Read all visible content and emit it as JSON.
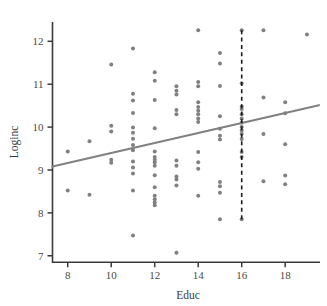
{
  "chart_data": {
    "type": "scatter",
    "title": "",
    "xlabel": "Educ",
    "ylabel": "Loginc",
    "xlim": [
      7.3,
      19.6
    ],
    "ylim": [
      6.85,
      12.45
    ],
    "xticks": [
      8,
      10,
      12,
      14,
      16,
      18
    ],
    "yticks": [
      7,
      8,
      9,
      10,
      11,
      12
    ],
    "xtick_labels": [
      "8",
      "10",
      "12",
      "14",
      "16",
      "18"
    ],
    "ytick_labels": [
      "7",
      "8",
      "9",
      "10",
      "11",
      "12"
    ],
    "grid": false,
    "legend": "none",
    "point_color": "#808080",
    "line_color": "#808080",
    "axis_color": "#3a3a3a",
    "marker_size": 2.0,
    "regression_line": {
      "name": "fitted regression line",
      "x": [
        7.3,
        19.55
      ],
      "y": [
        9.08,
        10.51
      ],
      "slope": 0.1167,
      "intercept": 8.228,
      "color": "#808080",
      "width": 2.2
    },
    "reference_line": {
      "name": "vertical dashed reference at Educ = 16",
      "orientation": "vertical",
      "x": 16,
      "y_from": 7.85,
      "y_to": 12.26,
      "style": "dashed",
      "color": "#1a1a1a",
      "width": 1.6
    },
    "points": [
      [
        8,
        9.43
      ],
      [
        8,
        8.52
      ],
      [
        9,
        9.67
      ],
      [
        9,
        8.42
      ],
      [
        10,
        11.46
      ],
      [
        10,
        10.03
      ],
      [
        10,
        9.9
      ],
      [
        10,
        9.24
      ],
      [
        10,
        9.17
      ],
      [
        11,
        11.83
      ],
      [
        11,
        10.78
      ],
      [
        11,
        10.62
      ],
      [
        11,
        10.33
      ],
      [
        11,
        9.99
      ],
      [
        11,
        9.87
      ],
      [
        11,
        9.73
      ],
      [
        11,
        9.58
      ],
      [
        11,
        9.46
      ],
      [
        11,
        9.2
      ],
      [
        11,
        9.06
      ],
      [
        11,
        8.92
      ],
      [
        11,
        8.52
      ],
      [
        11,
        7.47
      ],
      [
        12,
        11.28
      ],
      [
        12,
        11.08
      ],
      [
        12,
        10.63
      ],
      [
        12,
        9.97
      ],
      [
        12,
        9.43
      ],
      [
        12,
        9.3
      ],
      [
        12,
        9.24
      ],
      [
        12,
        9.18
      ],
      [
        12,
        9.1
      ],
      [
        12,
        8.88
      ],
      [
        12,
        8.6
      ],
      [
        12,
        8.4
      ],
      [
        12,
        8.32
      ],
      [
        12,
        8.24
      ],
      [
        12,
        8.18
      ],
      [
        13,
        10.95
      ],
      [
        13,
        10.85
      ],
      [
        13,
        10.76
      ],
      [
        13,
        10.4
      ],
      [
        13,
        10.3
      ],
      [
        13,
        9.22
      ],
      [
        13,
        9.1
      ],
      [
        13,
        8.85
      ],
      [
        13,
        8.78
      ],
      [
        13,
        8.64
      ],
      [
        13,
        7.07
      ],
      [
        14,
        12.26
      ],
      [
        14,
        11.05
      ],
      [
        14,
        10.95
      ],
      [
        14,
        10.58
      ],
      [
        14,
        10.47
      ],
      [
        14,
        10.38
      ],
      [
        14,
        10.3
      ],
      [
        14,
        10.2
      ],
      [
        14,
        10.12
      ],
      [
        14,
        9.42
      ],
      [
        14,
        9.18
      ],
      [
        14,
        9.03
      ],
      [
        14,
        8.4
      ],
      [
        15,
        11.73
      ],
      [
        15,
        11.48
      ],
      [
        15,
        10.96
      ],
      [
        15,
        10.25
      ],
      [
        15,
        9.96
      ],
      [
        15,
        9.8
      ],
      [
        15,
        9.71
      ],
      [
        15,
        8.72
      ],
      [
        15,
        8.62
      ],
      [
        15,
        8.47
      ],
      [
        15,
        7.85
      ],
      [
        16,
        12.26
      ],
      [
        16,
        11.02
      ],
      [
        16,
        10.48
      ],
      [
        16,
        10.42
      ],
      [
        16,
        10.3
      ],
      [
        16,
        10.2
      ],
      [
        16,
        10.1
      ],
      [
        16,
        10.0
      ],
      [
        16,
        9.92
      ],
      [
        16,
        9.84
      ],
      [
        16,
        9.72
      ],
      [
        16,
        9.42
      ],
      [
        16,
        9.3
      ],
      [
        16,
        7.85
      ],
      [
        17,
        12.26
      ],
      [
        17,
        10.69
      ],
      [
        17,
        9.84
      ],
      [
        17,
        8.74
      ],
      [
        18,
        10.58
      ],
      [
        18,
        10.32
      ],
      [
        18,
        9.6
      ],
      [
        18,
        8.87
      ],
      [
        18,
        8.67
      ],
      [
        19,
        12.16
      ]
    ]
  },
  "axis": {
    "x_title": "Educ",
    "y_title": "Loginc"
  }
}
